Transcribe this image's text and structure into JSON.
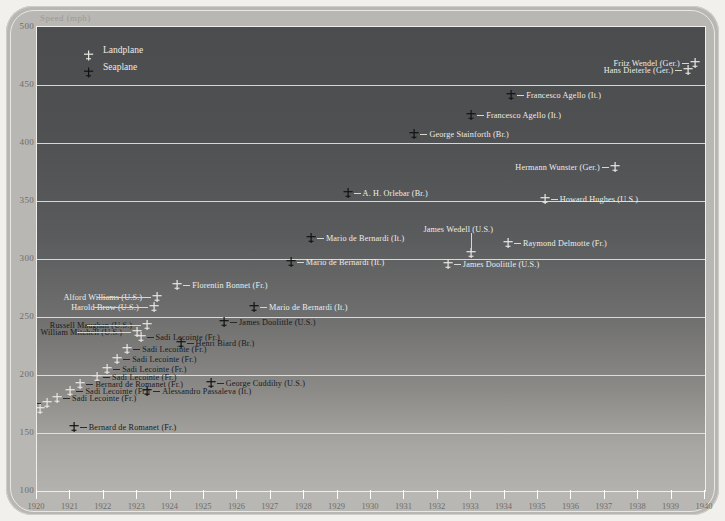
{
  "chart_data": {
    "type": "scatter",
    "title": "",
    "ylabel": "Speed (mph)",
    "xlabel": "",
    "ylim": [
      100,
      500
    ],
    "xlim": [
      1920,
      1940
    ],
    "yticks": [
      500,
      450,
      400,
      350,
      300,
      250,
      200,
      150,
      100
    ],
    "xticks": [
      1920,
      1921,
      1922,
      1923,
      1924,
      1925,
      1926,
      1927,
      1928,
      1929,
      1930,
      1931,
      1932,
      1933,
      1934,
      1935,
      1936,
      1937,
      1938,
      1939,
      1940
    ],
    "grid": true,
    "legend_position": "top-left",
    "legend": [
      {
        "label": "Landplane",
        "marker": "light-plane"
      },
      {
        "label": "Seaplane",
        "marker": "dark-plane"
      }
    ],
    "series": [
      {
        "name": "Landplane",
        "marker": "light-plane",
        "points": [
          {
            "label": "Fritz Wendel (Ger.)",
            "year": 1939.7,
            "speed": 469,
            "side": "left"
          },
          {
            "label": "Hans Dieterle (Ger.)",
            "year": 1939.5,
            "speed": 463,
            "side": "left"
          },
          {
            "label": "Hermann Wunster (Ger.)",
            "year": 1937.3,
            "speed": 379,
            "side": "left"
          },
          {
            "label": "Howard Hughes (U.S.)",
            "year": 1935.2,
            "speed": 352,
            "side": "right"
          },
          {
            "label": "Raymond Delmotte (Fr.)",
            "year": 1934.1,
            "speed": 314,
            "side": "right"
          },
          {
            "label": "James Wedell (U.S.)",
            "year": 1933.0,
            "speed": 305,
            "side": "top"
          },
          {
            "label": "James Doolittle (U.S.)",
            "year": 1932.3,
            "speed": 296,
            "side": "right"
          },
          {
            "label": "Florentin Bonnet (Fr.)",
            "year": 1924.2,
            "speed": 278,
            "side": "right"
          },
          {
            "label": "Alford Williams (U.S.)",
            "year": 1923.6,
            "speed": 267,
            "side": "left"
          },
          {
            "label": "Harold Brow (U.S.)",
            "year": 1923.5,
            "speed": 259,
            "side": "left"
          },
          {
            "label": "Russell Maughan (U.S.)",
            "year": 1923.3,
            "speed": 243,
            "side": "left"
          },
          {
            "label": "William Mitchell (U.S.)",
            "year": 1923.0,
            "speed": 237,
            "side": "left"
          },
          {
            "label": "Sadi Lecointe (Fr.)",
            "year": 1923.1,
            "speed": 233,
            "side": "right"
          },
          {
            "label": "Sadi Lecointe (Fr.)",
            "year": 1922.7,
            "speed": 222,
            "side": "right"
          },
          {
            "label": "Sadi Lecointe (Fr.)",
            "year": 1922.4,
            "speed": 214,
            "side": "right"
          },
          {
            "label": "Sadi Lecointe (Fr.)",
            "year": 1922.1,
            "speed": 205,
            "side": "right"
          },
          {
            "label": "Sadi Lecointe (Fr.)",
            "year": 1921.8,
            "speed": 198,
            "side": "right"
          },
          {
            "label": "Bernard de Romanet (Fr.)",
            "year": 1921.3,
            "speed": 192,
            "side": "right"
          },
          {
            "label": "Sadi Lecointe (Fr.)",
            "year": 1921.0,
            "speed": 186,
            "side": "right"
          },
          {
            "label": "Sadi Lecointe (Fr.)",
            "year": 1920.6,
            "speed": 180,
            "side": "right"
          },
          {
            "label": "Jean Casale (Fr.)",
            "year": 1920.3,
            "speed": 176,
            "side": "left"
          },
          {
            "label": "Sadi Lecointe (Fr.)",
            "year": 1920.1,
            "speed": 171,
            "side": "left"
          }
        ]
      },
      {
        "name": "Seaplane",
        "marker": "dark-plane",
        "points": [
          {
            "label": "Francesco Agello (It.)",
            "year": 1934.2,
            "speed": 441,
            "side": "right"
          },
          {
            "label": "Francesco Agello (It.)",
            "year": 1933.0,
            "speed": 424,
            "side": "right"
          },
          {
            "label": "George Stainforth (Br.)",
            "year": 1931.3,
            "speed": 408,
            "side": "right"
          },
          {
            "label": "A. H. Orlebar (Br.)",
            "year": 1929.3,
            "speed": 357,
            "side": "right"
          },
          {
            "label": "Mario de Bernardi (It.)",
            "year": 1928.2,
            "speed": 318,
            "side": "right"
          },
          {
            "label": "Mario de Bernardi (It.)",
            "year": 1927.6,
            "speed": 297,
            "side": "right"
          },
          {
            "label": "Mario de Bernardi (It.)",
            "year": 1926.5,
            "speed": 259,
            "side": "right"
          },
          {
            "label": "James Doolittle (U.S.)",
            "year": 1925.6,
            "speed": 246,
            "side": "right"
          },
          {
            "label": "Henri Biard (Br.)",
            "year": 1924.3,
            "speed": 228,
            "side": "right"
          },
          {
            "label": "George Cuddihy (U.S.)",
            "year": 1925.2,
            "speed": 193,
            "side": "right"
          },
          {
            "label": "Alessandro Passaleva (It.)",
            "year": 1923.3,
            "speed": 186,
            "side": "right"
          },
          {
            "label": "Bernard de Romanet (Fr.)",
            "year": 1921.1,
            "speed": 155,
            "side": "right"
          }
        ]
      }
    ]
  }
}
